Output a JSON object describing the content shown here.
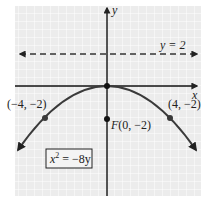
{
  "diagram": {
    "type": "parabola",
    "equation": "x² = −8y",
    "equation_parts": {
      "base": "x",
      "exp": "2",
      "rest": " = −8y"
    },
    "axes": {
      "x_label": "x",
      "y_label": "y"
    },
    "directrix": {
      "label": "y = 2",
      "value": 2
    },
    "focus": {
      "label": "F(0, −2)",
      "x": 0,
      "y": -2
    },
    "points": [
      {
        "label": "(−4, −2)",
        "x": -4,
        "y": -2
      },
      {
        "label": "(4, −2)",
        "x": 4,
        "y": -2
      }
    ],
    "vertex": {
      "x": 0,
      "y": 0
    },
    "colors": {
      "grid_bg": "#ececec",
      "grid_line": "#ffffff",
      "curve": "#3a3a3a",
      "axis": "#111111"
    }
  }
}
